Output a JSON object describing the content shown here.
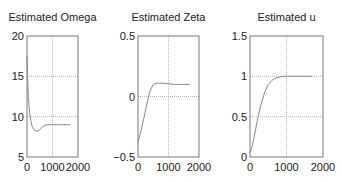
{
  "chart_data": [
    {
      "type": "line",
      "title": "Estimated Omega",
      "xlabel": "",
      "ylabel": "",
      "xlim": [
        0,
        2000
      ],
      "ylim": [
        5,
        20
      ],
      "xticks": [
        0,
        1000,
        2000
      ],
      "yticks": [
        5,
        10,
        15,
        20
      ],
      "xtick_labels": [
        "0",
        "1000",
        "2000"
      ],
      "ytick_labels": [
        "5",
        "10",
        "15",
        "20"
      ],
      "grid": true,
      "series": [
        {
          "name": "omega",
          "x": [
            0,
            20,
            50,
            100,
            150,
            200,
            300,
            400,
            500,
            600,
            700,
            800,
            1000,
            1200,
            1400,
            1600,
            1700
          ],
          "y": [
            17.5,
            15.5,
            12.5,
            10.5,
            9.5,
            8.8,
            8.3,
            8.2,
            8.4,
            8.7,
            8.9,
            9.0,
            9.0,
            9.0,
            9.0,
            9.0,
            9.0
          ]
        }
      ]
    },
    {
      "type": "line",
      "title": "Estimated Zeta",
      "xlabel": "",
      "ylabel": "",
      "xlim": [
        0,
        2000
      ],
      "ylim": [
        -0.5,
        0.5
      ],
      "xticks": [
        0,
        1000,
        2000
      ],
      "yticks": [
        -0.5,
        0,
        0.5
      ],
      "xtick_labels": [
        "0",
        "1000",
        "2000"
      ],
      "ytick_labels": [
        "-0.5",
        "0",
        "0.5"
      ],
      "grid": true,
      "series": [
        {
          "name": "zeta",
          "x": [
            0,
            100,
            200,
            300,
            400,
            500,
            600,
            700,
            800,
            1000,
            1200,
            1400,
            1700
          ],
          "y": [
            -0.38,
            -0.28,
            -0.17,
            -0.05,
            0.05,
            0.1,
            0.11,
            0.11,
            0.11,
            0.105,
            0.1,
            0.1,
            0.1
          ]
        }
      ]
    },
    {
      "type": "line",
      "title": "Estimated u",
      "xlabel": "",
      "ylabel": "",
      "xlim": [
        0,
        2000
      ],
      "ylim": [
        0,
        1.5
      ],
      "xticks": [
        0,
        1000,
        2000
      ],
      "yticks": [
        0,
        0.5,
        1,
        1.5
      ],
      "xtick_labels": [
        "0",
        "1000",
        "2000"
      ],
      "ytick_labels": [
        "0",
        "0.5",
        "1",
        "1.5"
      ],
      "grid": true,
      "series": [
        {
          "name": "u",
          "x": [
            0,
            50,
            100,
            200,
            300,
            400,
            500,
            600,
            700,
            800,
            900,
            1000,
            1200,
            1400,
            1700
          ],
          "y": [
            0.05,
            0.12,
            0.22,
            0.45,
            0.65,
            0.8,
            0.9,
            0.95,
            0.98,
            0.99,
            1.0,
            1.0,
            1.0,
            1.0,
            1.0
          ]
        }
      ]
    }
  ],
  "colors": {
    "axis": "#555555",
    "grid": "#999999",
    "line": "#888888",
    "text": "#222222"
  },
  "layout": [
    {
      "left": 27,
      "top": 36,
      "right": 78,
      "bottom": 157
    },
    {
      "left": 138,
      "top": 36,
      "right": 199,
      "bottom": 157
    },
    {
      "left": 250,
      "top": 36,
      "right": 323,
      "bottom": 157
    }
  ]
}
